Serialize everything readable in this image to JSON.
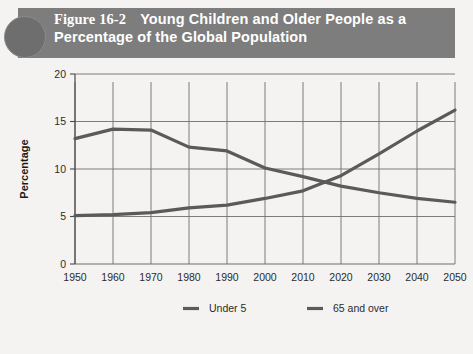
{
  "header": {
    "figure_number": "Figure 16-2",
    "title_line1": "Young Children and Older People as a",
    "title_line2": "Percentage of the Global Population",
    "band_color": "#7d7d7d",
    "circle_color": "#6e6e6e",
    "text_color": "#ffffff"
  },
  "chart_data": {
    "type": "line",
    "title": "Young Children and Older People as a Percentage of the Global Population",
    "xlabel": "",
    "ylabel": "Percentage",
    "x": [
      1950,
      1960,
      1970,
      1980,
      1990,
      2000,
      2010,
      2020,
      2030,
      2040,
      2050
    ],
    "xlim": [
      1950,
      2050
    ],
    "ylim": [
      0,
      20
    ],
    "yticks": [
      0,
      5,
      10,
      15,
      20
    ],
    "xticks": [
      "1950",
      "1960",
      "1970",
      "1980",
      "1990",
      "2000",
      "2010",
      "2020",
      "2030",
      "2040",
      "2050"
    ],
    "grid": true,
    "legend_position": "bottom",
    "series": [
      {
        "name": "Under 5",
        "color": "#5a5a5a",
        "values": [
          13.2,
          14.2,
          14.1,
          12.3,
          11.9,
          10.1,
          9.2,
          8.2,
          7.5,
          6.9,
          6.5
        ]
      },
      {
        "name": "65 and over",
        "color": "#5a5a5a",
        "values": [
          5.1,
          5.2,
          5.4,
          5.9,
          6.2,
          6.9,
          7.7,
          9.3,
          11.6,
          14.0,
          16.2
        ]
      }
    ]
  },
  "legend": {
    "items": [
      {
        "label": "Under 5",
        "color": "#5a5a5a"
      },
      {
        "label": "65 and over",
        "color": "#5a5a5a"
      }
    ]
  },
  "colors": {
    "page_background": "#f4f3f1",
    "grid": "#6f6f6f",
    "axis": "#4a4a4a",
    "line": "#5a5a5a"
  }
}
